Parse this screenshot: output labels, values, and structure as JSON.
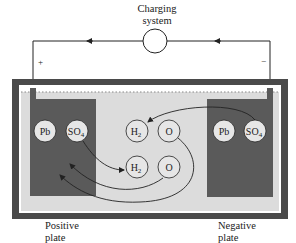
{
  "diagram": {
    "charging_system": {
      "label_line1": "Charging",
      "label_line2": "system"
    },
    "terminals": {
      "positive": "+",
      "negative": "−"
    },
    "positive_plate": {
      "label_line1": "Positive",
      "label_line2": "plate",
      "circles": [
        {
          "text": "Pb",
          "sub": ""
        },
        {
          "text": "SO",
          "sub": "4"
        }
      ]
    },
    "negative_plate": {
      "label_line1": "Negative",
      "label_line2": "plate",
      "circles": [
        {
          "text": "Pb",
          "sub": ""
        },
        {
          "text": "SO",
          "sub": "4"
        }
      ]
    },
    "electrolyte_molecules": [
      {
        "text": "H",
        "sub": "2"
      },
      {
        "text": "O",
        "sub": ""
      },
      {
        "text": "H",
        "sub": "2"
      },
      {
        "text": "O",
        "sub": ""
      }
    ],
    "colors": {
      "case": "#4a4a4a",
      "plate": "#5a5a5a",
      "electrolyte": "#dcdcdc",
      "circle_fill": "#e6e6e6",
      "line": "#222222"
    }
  }
}
